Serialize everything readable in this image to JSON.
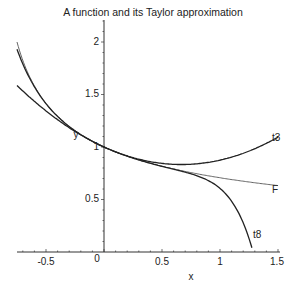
{
  "chart_data": {
    "type": "line",
    "title": "A function and its Taylor approximation",
    "xlabel": "x",
    "ylabel": "y",
    "xlim": [
      -0.75,
      1.5
    ],
    "ylim": [
      0,
      2.2
    ],
    "x_ticks": [
      "-0.5",
      "0",
      "0.5",
      "1",
      "1.5"
    ],
    "y_ticks": [
      "0.5",
      "1",
      "1.5",
      "2"
    ],
    "grid": false,
    "series": [
      {
        "name": "F",
        "formula": "1/sqrt(1+x)",
        "x": [
          -0.75,
          -0.5,
          0,
          0.5,
          1,
          1.5
        ],
        "values": [
          2.0,
          1.414,
          1.0,
          0.816,
          0.707,
          0.632
        ]
      },
      {
        "name": "t3",
        "formula": "1 - x/2 + 3x^2/8",
        "x": [
          -0.75,
          -0.5,
          0,
          0.5,
          1,
          1.5
        ],
        "values": [
          1.586,
          1.344,
          1.0,
          0.844,
          0.875,
          1.094
        ]
      },
      {
        "name": "t8",
        "formula": "Taylor polynomial of 1/sqrt(1+x), 8 terms",
        "x": [
          -0.75,
          -0.5,
          0,
          0.5,
          1,
          1.25
        ],
        "values": [
          1.95,
          1.41,
          1.0,
          0.815,
          0.63,
          0.0
        ]
      }
    ],
    "annotations": [
      "t3",
      "F",
      "t8",
      "y",
      "x"
    ]
  }
}
